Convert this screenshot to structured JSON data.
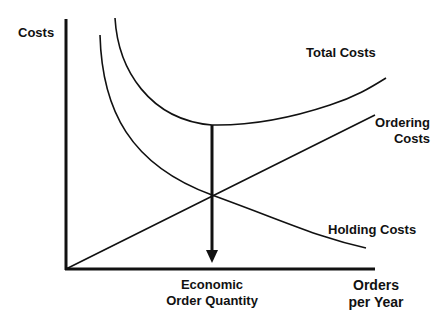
{
  "diagram": {
    "y_axis_label": "Costs",
    "x_axis_label_line1": "Orders",
    "x_axis_label_line2": "per Year",
    "eoq_label_line1": "Economic",
    "eoq_label_line2": "Order Quantity",
    "curves": {
      "total": {
        "label": "Total Costs",
        "shape": "U-shaped",
        "color": "#111111"
      },
      "ordering": {
        "label_line1": "Ordering",
        "label_line2": "Costs",
        "shape": "rising straight line",
        "color": "#111111"
      },
      "holding": {
        "label": "Holding Costs",
        "shape": "decreasing convex curve",
        "color": "#111111"
      }
    },
    "annotation": {
      "type": "downward arrow",
      "from": "minimum of Total Costs",
      "through": "intersection of Ordering and Holding Costs",
      "to": "Economic Order Quantity on x-axis"
    }
  }
}
